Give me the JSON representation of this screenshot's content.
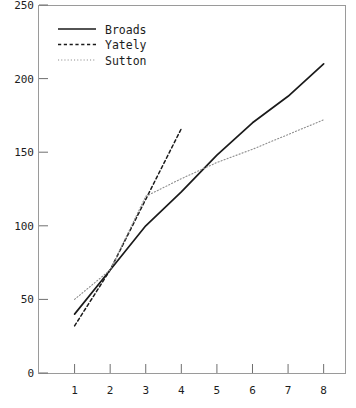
{
  "chart_data": {
    "type": "line",
    "title": "",
    "xlabel": "",
    "ylabel": "",
    "xlim": [
      0,
      8.6
    ],
    "ylim": [
      0,
      250
    ],
    "xticks": [
      1,
      2,
      3,
      4,
      5,
      6,
      7,
      8
    ],
    "yticks": [
      0,
      50,
      100,
      150,
      200,
      250
    ],
    "xticklabels": [
      "1",
      "2",
      "3",
      "4",
      "5",
      "6",
      "7",
      "8"
    ],
    "yticklabels": [
      "0",
      "50",
      "100",
      "150",
      "200",
      "250"
    ],
    "grid": false,
    "legend_position": "upper left",
    "frame": true,
    "series": [
      {
        "name": "Broads",
        "style": "solid",
        "color": "#1a1a1a",
        "x": [
          1,
          2,
          3,
          4,
          5,
          6,
          7,
          8
        ],
        "values": [
          40,
          70,
          100,
          123,
          148,
          170,
          188,
          210
        ]
      },
      {
        "name": "Yately",
        "style": "dashed",
        "color": "#1a1a1a",
        "x": [
          1,
          2,
          3,
          4
        ],
        "values": [
          32,
          70,
          118,
          166
        ]
      },
      {
        "name": "Sutton",
        "style": "dotted",
        "color": "#8c8c8c",
        "x": [
          1,
          2,
          3,
          4,
          5,
          6,
          7,
          8
        ],
        "values": [
          50,
          70,
          120,
          132,
          143,
          152,
          162,
          172
        ]
      }
    ]
  },
  "legend": {
    "entries": [
      {
        "label": "Broads"
      },
      {
        "label": "Yately"
      },
      {
        "label": "Sutton"
      }
    ]
  },
  "axes": {
    "y": {
      "labels": [
        "250",
        "200",
        "150",
        "100",
        "50",
        "0"
      ]
    },
    "x": {
      "labels": [
        "1",
        "2",
        "3",
        "4",
        "5",
        "6",
        "7",
        "8"
      ]
    }
  }
}
